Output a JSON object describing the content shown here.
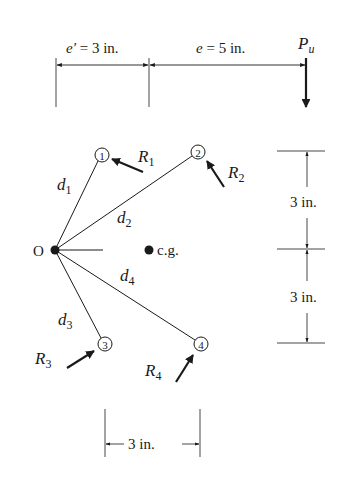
{
  "diagram": {
    "type": "eccentric bolt group / instantaneous center of rotation",
    "colors": {
      "line": "#1a1a1a",
      "background": "#ffffff"
    },
    "top_dimensions": {
      "e_prime": {
        "symbol": "e′",
        "eq": " = 3 in."
      },
      "e": {
        "symbol": "e",
        "eq": " = 5 in."
      }
    },
    "load": {
      "symbol": "P",
      "subscript": "u"
    },
    "center": {
      "label": "O"
    },
    "cg": {
      "label": "c.g."
    },
    "bolts": [
      {
        "number": "1",
        "force": "R",
        "force_sub": "1",
        "distance": "d",
        "distance_sub": "1"
      },
      {
        "number": "2",
        "force": "R",
        "force_sub": "2",
        "distance": "d",
        "distance_sub": "2"
      },
      {
        "number": "3",
        "force": "R",
        "force_sub": "3",
        "distance": "d",
        "distance_sub": "3"
      },
      {
        "number": "4",
        "force": "R",
        "force_sub": "4",
        "distance": "d",
        "distance_sub": "4"
      }
    ],
    "right_dimensions": {
      "upper": "3 in.",
      "lower": "3 in."
    },
    "bottom_dimension": "3 in."
  }
}
